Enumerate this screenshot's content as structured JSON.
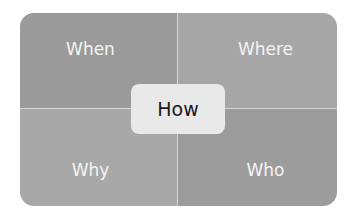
{
  "diagram": {
    "type": "quadrant",
    "quadrants": {
      "top_left": "When",
      "top_right": "Where",
      "bottom_left": "Why",
      "bottom_right": "Who"
    },
    "center": "How",
    "colors": {
      "quadrant_fill": "#a0a0a0",
      "center_fill": "#e9e9e9",
      "quadrant_text": "#f4f4f4",
      "center_text": "#1a1a1a"
    }
  }
}
